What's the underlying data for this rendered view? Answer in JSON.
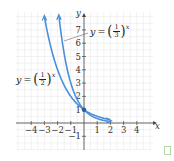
{
  "chart_data": {
    "type": "line",
    "title": "",
    "xlabel": "x",
    "ylabel": "y",
    "xlim": [
      -5,
      5
    ],
    "ylim": [
      -2,
      8.5
    ],
    "grid": true,
    "x_ticks": [
      -4,
      -3,
      -2,
      -1,
      1,
      2,
      3,
      4
    ],
    "y_ticks": [
      -1,
      1,
      2,
      3,
      4,
      5,
      6,
      7
    ],
    "x_tick_labels": [
      "−4",
      "−3",
      "−2",
      "−1",
      "1",
      "2",
      "3",
      "4"
    ],
    "y_tick_labels": [
      "−1",
      "1",
      "2",
      "3",
      "4",
      "5",
      "6",
      "7"
    ],
    "series": [
      {
        "name": "y = (1/2)^x",
        "x": [
          -3,
          -2,
          -1,
          0,
          1,
          2
        ],
        "values": [
          8,
          4,
          2,
          1,
          0.5,
          0.25
        ],
        "color": "#4a90d9"
      },
      {
        "name": "y = (1/3)^x",
        "x": [
          -2,
          -1,
          0,
          1,
          2
        ],
        "values": [
          9,
          3,
          1,
          0.333,
          0.111
        ],
        "color": "#4a90d9"
      }
    ],
    "annotations": [
      {
        "text": "y = (1/2)^x",
        "position": "left of curves near y≈3.5"
      },
      {
        "text": "y = (1/3)^x",
        "position": "right of y-axis near y≈7, with leader line"
      }
    ],
    "marked_point": {
      "x": 0,
      "y": 1
    }
  },
  "labels": {
    "y_axis": "y",
    "x_axis": "x",
    "eq_half": {
      "lhs": "y",
      "eq": "=",
      "num": "1",
      "den": "2",
      "exp": "x"
    },
    "eq_third": {
      "lhs": "y",
      "eq": "=",
      "num": "1",
      "den": "3",
      "exp": "x"
    }
  },
  "colors": {
    "curve": "#4a90d9",
    "grid": "#e4e4e4",
    "axis": "#444444"
  }
}
